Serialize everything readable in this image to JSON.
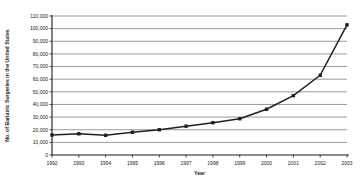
{
  "chart_data": {
    "type": "line",
    "title": "",
    "xlabel": "Year",
    "ylabel": "No. of Bariatric Surgeries in the United States",
    "categories": [
      1992,
      1993,
      1994,
      1995,
      1996,
      1997,
      1998,
      1999,
      2000,
      2001,
      2002,
      2003
    ],
    "x_tick_labels": [
      "1992",
      "1993",
      "1994",
      "1995",
      "1996",
      "1997",
      "1998",
      "1999",
      "2000",
      "2001",
      "2002",
      "2003"
    ],
    "values": [
      15800,
      16800,
      15600,
      18000,
      20000,
      22800,
      25600,
      28700,
      36200,
      47000,
      63100,
      103000
    ],
    "y_tick_labels": [
      "0",
      "10,000",
      "20,000",
      "30,000",
      "40,000",
      "50,000",
      "60,000",
      "70,000",
      "80,000",
      "90,000",
      "100,000",
      "110,000"
    ],
    "y_ticks": [
      0,
      10000,
      20000,
      30000,
      40000,
      50000,
      60000,
      70000,
      80000,
      90000,
      100000,
      110000
    ],
    "ylim": [
      0,
      110000
    ],
    "xlim": [
      1992,
      2003
    ],
    "grid": "horizontal",
    "legend": "none",
    "marker": "square",
    "series_color": "#1f1f1f",
    "grid_color": "#808080",
    "axis_color": "#1a1a1a"
  }
}
